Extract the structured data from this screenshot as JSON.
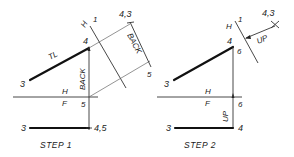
{
  "figure": {
    "panels": [
      {
        "id": "step-1",
        "caption": "STEP 1",
        "labels": {
          "top_point_3": "3",
          "top_point_4": "4",
          "true_length": "TL",
          "fold_h_upper": "H",
          "fold_f_lower": "F",
          "point_5_front": "5",
          "front_point_3": "3",
          "front_point_45": "4,5",
          "aux_fold_h": "H",
          "aux_fold_1": "1",
          "aux_point_43": "4,3",
          "aux_point_5": "5",
          "back_vertical": "BACK",
          "back_aux": "BACK"
        }
      },
      {
        "id": "step-2",
        "caption": "STEP 2",
        "labels": {
          "top_point_3": "3",
          "top_point_4": "4",
          "top_point_6": "6",
          "fold_h_upper": "H",
          "fold_f_lower": "F",
          "point_6_front": "6",
          "front_point_3": "3",
          "front_point_4": "4",
          "aux_fold_h": "H",
          "aux_fold_1": "1",
          "aux_point_43": "4,3",
          "up_vertical": "UP",
          "up_aux": "UP"
        }
      }
    ]
  }
}
